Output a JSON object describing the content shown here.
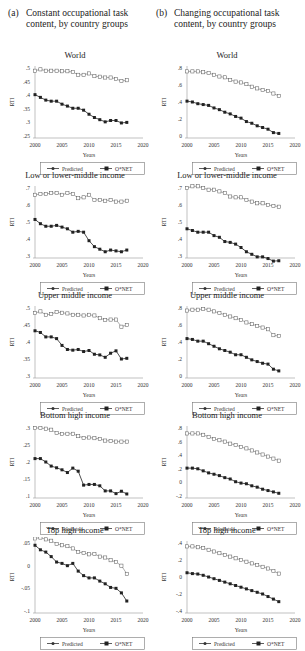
{
  "columns": [
    {
      "tag": "(a)",
      "title_line1": "Constant occupational task",
      "title_line2": "content, by country groups"
    },
    {
      "tag": "(b)",
      "title_line1": "Changing occupational task",
      "title_line2": "content, by country groups"
    }
  ],
  "legend": {
    "predicted": "Predicted",
    "onet": "O*NET"
  },
  "axis": {
    "xlabel": "Years",
    "ylabel": "RTI",
    "xticks": [
      2000,
      2005,
      2010,
      2015,
      2020
    ]
  },
  "chart_data": [
    {
      "type": "line",
      "panel": "a",
      "title": "World",
      "xlabel": "Years",
      "ylabel": "RTI",
      "xlim": [
        2000,
        2020
      ],
      "ylim": [
        0.25,
        0.5
      ],
      "yticks": [
        0.25,
        0.3,
        0.35,
        0.4,
        0.45,
        0.5
      ],
      "yticklabels": [
        ".25",
        ".3",
        ".35",
        ".4",
        ".45",
        ".5"
      ],
      "x": [
        2000,
        2001,
        2002,
        2003,
        2004,
        2005,
        2006,
        2007,
        2008,
        2009,
        2010,
        2011,
        2012,
        2013,
        2014,
        2015,
        2016,
        2017
      ],
      "series": [
        {
          "name": "Predicted",
          "values": [
            0.49,
            0.495,
            0.49,
            0.49,
            0.49,
            0.488,
            0.488,
            0.485,
            0.475,
            0.475,
            0.48,
            0.47,
            0.468,
            0.465,
            0.465,
            0.46,
            0.452,
            0.455
          ]
        },
        {
          "name": "O*NET",
          "values": [
            0.402,
            0.392,
            0.382,
            0.378,
            0.378,
            0.367,
            0.36,
            0.352,
            0.352,
            0.345,
            0.33,
            0.318,
            0.31,
            0.302,
            0.307,
            0.307,
            0.298,
            0.3
          ]
        }
      ]
    },
    {
      "type": "line",
      "panel": "a",
      "title": "Low or lower-middle income",
      "xlabel": "Years",
      "ylabel": "RTI",
      "xlim": [
        2000,
        2020
      ],
      "ylim": [
        0.3,
        0.7
      ],
      "yticks": [
        0.3,
        0.4,
        0.5,
        0.6,
        0.7
      ],
      "yticklabels": [
        ".3",
        ".4",
        ".5",
        ".6",
        ".7"
      ],
      "x": [
        2000,
        2001,
        2002,
        2003,
        2004,
        2005,
        2006,
        2007,
        2008,
        2009,
        2010,
        2011,
        2012,
        2013,
        2014,
        2015,
        2016,
        2017
      ],
      "series": [
        {
          "name": "Predicted",
          "values": [
            0.66,
            0.665,
            0.665,
            0.67,
            0.67,
            0.66,
            0.67,
            0.665,
            0.64,
            0.645,
            0.66,
            0.63,
            0.63,
            0.625,
            0.63,
            0.62,
            0.62,
            0.625
          ]
        },
        {
          "name": "O*NET",
          "values": [
            0.515,
            0.49,
            0.475,
            0.475,
            0.48,
            0.47,
            0.46,
            0.44,
            0.445,
            0.44,
            0.39,
            0.355,
            0.34,
            0.325,
            0.335,
            0.33,
            0.325,
            0.335
          ]
        }
      ]
    },
    {
      "type": "line",
      "panel": "a",
      "title": "Upper middle income",
      "xlabel": "Years",
      "ylabel": "RTI",
      "xlim": [
        2000,
        2020
      ],
      "ylim": [
        0.3,
        0.5
      ],
      "yticks": [
        0.3,
        0.35,
        0.4,
        0.45,
        0.5
      ],
      "yticklabels": [
        ".3",
        ".35",
        ".4",
        ".45",
        ".5"
      ],
      "x": [
        2000,
        2001,
        2002,
        2003,
        2004,
        2005,
        2006,
        2007,
        2008,
        2009,
        2010,
        2011,
        2012,
        2013,
        2014,
        2015,
        2016,
        2017
      ],
      "series": [
        {
          "name": "Predicted",
          "values": [
            0.485,
            0.49,
            0.48,
            0.482,
            0.488,
            0.486,
            0.484,
            0.48,
            0.48,
            0.478,
            0.48,
            0.478,
            0.47,
            0.465,
            0.466,
            0.466,
            0.445,
            0.45
          ]
        },
        {
          "name": "O*NET",
          "values": [
            0.433,
            0.428,
            0.415,
            0.415,
            0.41,
            0.39,
            0.378,
            0.376,
            0.378,
            0.372,
            0.375,
            0.364,
            0.362,
            0.355,
            0.367,
            0.374,
            0.35,
            0.352
          ]
        }
      ]
    },
    {
      "type": "line",
      "panel": "a",
      "title": "Bottom high income",
      "xlabel": "Years",
      "ylabel": "RTI",
      "xlim": [
        2000,
        2020
      ],
      "ylim": [
        0.1,
        0.3
      ],
      "yticks": [
        0.1,
        0.15,
        0.2,
        0.25,
        0.3
      ],
      "yticklabels": [
        ".1",
        ".15",
        ".2",
        ".25",
        ".3"
      ],
      "x": [
        2000,
        2001,
        2002,
        2003,
        2004,
        2005,
        2006,
        2007,
        2008,
        2009,
        2010,
        2011,
        2012,
        2013,
        2014,
        2015,
        2016,
        2017
      ],
      "series": [
        {
          "name": "Predicted",
          "values": [
            0.3,
            0.3,
            0.298,
            0.295,
            0.285,
            0.282,
            0.283,
            0.283,
            0.276,
            0.271,
            0.272,
            0.27,
            0.268,
            0.263,
            0.262,
            0.26,
            0.26,
            0.26
          ]
        },
        {
          "name": "O*NET",
          "values": [
            0.21,
            0.21,
            0.2,
            0.188,
            0.183,
            0.177,
            0.169,
            0.182,
            0.173,
            0.132,
            0.134,
            0.134,
            0.13,
            0.115,
            0.115,
            0.107,
            0.114,
            0.106
          ]
        }
      ]
    },
    {
      "type": "line",
      "panel": "a",
      "title": "Top high income",
      "xlabel": "Years",
      "ylabel": "RTI",
      "xlim": [
        2000,
        2020
      ],
      "ylim": [
        -0.1,
        0.05
      ],
      "yticks": [
        -0.1,
        -0.05,
        0,
        0.05
      ],
      "yticklabels": [
        "-.1",
        "-.05",
        "0",
        ".05"
      ],
      "x": [
        2000,
        2001,
        2002,
        2003,
        2004,
        2005,
        2006,
        2007,
        2008,
        2009,
        2010,
        2011,
        2012,
        2013,
        2014,
        2015,
        2016,
        2017
      ],
      "series": [
        {
          "name": "Predicted",
          "values": [
            0.06,
            0.062,
            0.058,
            0.055,
            0.048,
            0.045,
            0.043,
            0.038,
            0.03,
            0.028,
            0.025,
            0.026,
            0.02,
            0.018,
            0.012,
            0.008,
            0.0,
            -0.018
          ]
        },
        {
          "name": "O*NET",
          "values": [
            0.045,
            0.035,
            0.03,
            0.02,
            0.008,
            0.005,
            0.0,
            0.005,
            -0.012,
            -0.022,
            -0.027,
            -0.027,
            -0.034,
            -0.04,
            -0.048,
            -0.05,
            -0.06,
            -0.078
          ]
        }
      ]
    },
    {
      "type": "line",
      "panel": "b",
      "title": "World",
      "xlabel": "Years",
      "ylabel": "RTI",
      "xlim": [
        2000,
        2020
      ],
      "ylim": [
        0,
        0.8
      ],
      "yticks": [
        0,
        0.2,
        0.4,
        0.6,
        0.8
      ],
      "yticklabels": [
        "0",
        ".2",
        ".4",
        ".6",
        ".8"
      ],
      "x": [
        2000,
        2001,
        2002,
        2003,
        2004,
        2005,
        2006,
        2007,
        2008,
        2009,
        2010,
        2011,
        2012,
        2013,
        2014,
        2015,
        2016,
        2017
      ],
      "series": [
        {
          "name": "Predicted",
          "values": [
            0.76,
            0.76,
            0.76,
            0.75,
            0.74,
            0.72,
            0.7,
            0.69,
            0.66,
            0.64,
            0.63,
            0.61,
            0.58,
            0.56,
            0.54,
            0.53,
            0.5,
            0.47
          ]
        },
        {
          "name": "O*NET",
          "values": [
            0.41,
            0.4,
            0.38,
            0.37,
            0.36,
            0.33,
            0.31,
            0.28,
            0.26,
            0.23,
            0.21,
            0.17,
            0.15,
            0.12,
            0.1,
            0.08,
            0.04,
            0.03
          ]
        }
      ]
    },
    {
      "type": "line",
      "panel": "b",
      "title": "Low or lower-middle income",
      "xlabel": "Years",
      "ylabel": "RTI",
      "xlim": [
        2000,
        2020
      ],
      "ylim": [
        0.3,
        0.7
      ],
      "yticks": [
        0.3,
        0.4,
        0.5,
        0.6,
        0.7
      ],
      "yticklabels": [
        ".3",
        ".4",
        ".5",
        ".6",
        ".7"
      ],
      "x": [
        2000,
        2001,
        2002,
        2003,
        2004,
        2005,
        2006,
        2007,
        2008,
        2009,
        2010,
        2011,
        2012,
        2013,
        2014,
        2015,
        2016,
        2017
      ],
      "series": [
        {
          "name": "Predicted",
          "values": [
            0.7,
            0.71,
            0.71,
            0.7,
            0.69,
            0.69,
            0.68,
            0.67,
            0.65,
            0.645,
            0.645,
            0.63,
            0.62,
            0.61,
            0.61,
            0.6,
            0.595,
            0.59
          ]
        },
        {
          "name": "O*NET",
          "values": [
            0.46,
            0.45,
            0.44,
            0.44,
            0.44,
            0.42,
            0.41,
            0.385,
            0.38,
            0.37,
            0.35,
            0.325,
            0.31,
            0.295,
            0.295,
            0.285,
            0.27,
            0.272
          ]
        }
      ]
    },
    {
      "type": "line",
      "panel": "b",
      "title": "Upper middle income",
      "xlabel": "Years",
      "ylabel": "RTI",
      "xlim": [
        2000,
        2020
      ],
      "ylim": [
        0,
        0.8
      ],
      "yticks": [
        0,
        0.2,
        0.4,
        0.6,
        0.8
      ],
      "yticklabels": [
        "0",
        ".2",
        ".4",
        ".6",
        ".8"
      ],
      "x": [
        2000,
        2001,
        2002,
        2003,
        2004,
        2005,
        2006,
        2007,
        2008,
        2009,
        2010,
        2011,
        2012,
        2013,
        2014,
        2015,
        2016,
        2017
      ],
      "series": [
        {
          "name": "Predicted",
          "values": [
            0.77,
            0.78,
            0.78,
            0.79,
            0.78,
            0.76,
            0.74,
            0.72,
            0.7,
            0.68,
            0.66,
            0.63,
            0.61,
            0.59,
            0.57,
            0.55,
            0.48,
            0.47
          ]
        },
        {
          "name": "O*NET",
          "values": [
            0.44,
            0.43,
            0.41,
            0.41,
            0.38,
            0.35,
            0.32,
            0.3,
            0.28,
            0.25,
            0.25,
            0.22,
            0.19,
            0.17,
            0.15,
            0.14,
            0.08,
            0.06
          ]
        }
      ]
    },
    {
      "type": "line",
      "panel": "b",
      "title": "Bottom high income",
      "xlabel": "Years",
      "ylabel": "RTI",
      "xlim": [
        2000,
        2020
      ],
      "ylim": [
        -0.2,
        0.8
      ],
      "yticks": [
        -0.2,
        0,
        0.2,
        0.4,
        0.6,
        0.8
      ],
      "yticklabels": [
        "-.2",
        "0",
        ".2",
        ".4",
        ".6",
        ".8"
      ],
      "x": [
        2000,
        2001,
        2002,
        2003,
        2004,
        2005,
        2006,
        2007,
        2008,
        2009,
        2010,
        2011,
        2012,
        2013,
        2014,
        2015,
        2016,
        2017
      ],
      "series": [
        {
          "name": "Predicted",
          "values": [
            0.72,
            0.72,
            0.72,
            0.7,
            0.67,
            0.64,
            0.62,
            0.6,
            0.57,
            0.55,
            0.52,
            0.5,
            0.47,
            0.44,
            0.41,
            0.38,
            0.35,
            0.32
          ]
        },
        {
          "name": "O*NET",
          "values": [
            0.21,
            0.21,
            0.2,
            0.17,
            0.14,
            0.12,
            0.1,
            0.07,
            0.05,
            0.01,
            -0.01,
            -0.02,
            -0.05,
            -0.07,
            -0.1,
            -0.12,
            -0.14,
            -0.16
          ]
        }
      ]
    },
    {
      "type": "line",
      "panel": "b",
      "title": "Top high income",
      "xlabel": "Years",
      "ylabel": "RTI",
      "xlim": [
        2000,
        2020
      ],
      "ylim": [
        -0.4,
        0.4
      ],
      "yticks": [
        -0.4,
        -0.2,
        0,
        0.2,
        0.4
      ],
      "yticklabels": [
        "-.4",
        "-.2",
        "0",
        ".2",
        ".4"
      ],
      "x": [
        2000,
        2001,
        2002,
        2003,
        2004,
        2005,
        2006,
        2007,
        2008,
        2009,
        2010,
        2011,
        2012,
        2013,
        2014,
        2015,
        2016,
        2017
      ],
      "series": [
        {
          "name": "Predicted",
          "values": [
            0.36,
            0.36,
            0.35,
            0.34,
            0.32,
            0.3,
            0.28,
            0.26,
            0.24,
            0.22,
            0.2,
            0.18,
            0.16,
            0.14,
            0.12,
            0.1,
            0.07,
            0.04
          ]
        },
        {
          "name": "O*NET",
          "values": [
            0.05,
            0.04,
            0.035,
            0.02,
            0.0,
            -0.02,
            -0.04,
            -0.06,
            -0.08,
            -0.1,
            -0.12,
            -0.14,
            -0.16,
            -0.18,
            -0.2,
            -0.23,
            -0.26,
            -0.29
          ]
        }
      ]
    }
  ]
}
